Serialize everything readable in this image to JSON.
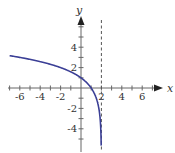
{
  "chart_data": {
    "type": "line",
    "title": "",
    "xlabel": "x",
    "ylabel": "y",
    "xlim": [
      -7,
      7.5
    ],
    "ylim": [
      -6,
      7
    ],
    "x_ticks": [
      -6,
      -4,
      -2,
      2,
      4,
      6
    ],
    "x_minor_ticks": [
      -7,
      -6,
      -5,
      -4,
      -3,
      -2,
      -1,
      1,
      2,
      3,
      4,
      5,
      6,
      7
    ],
    "y_ticks": [
      4,
      2,
      -2,
      -4
    ],
    "y_minor_ticks": [
      -5,
      -4,
      -3,
      -2,
      -1,
      1,
      2,
      3,
      4,
      5,
      6
    ],
    "x_tick_labels": [
      "-6",
      "-4",
      "-2",
      "2",
      "4",
      "6"
    ],
    "y_tick_labels": [
      "4",
      "2",
      "-2",
      "-4"
    ],
    "grid": false,
    "series": [
      {
        "name": "y = log2(2 - x)",
        "function": "log2(2 - x)",
        "domain": [
          -7,
          1.98
        ],
        "points": [
          [
            -7,
            3.17
          ],
          [
            -6,
            3
          ],
          [
            -4,
            2.58
          ],
          [
            -2,
            2
          ],
          [
            0,
            1
          ],
          [
            1,
            0
          ],
          [
            1.5,
            -1
          ],
          [
            1.75,
            -2
          ],
          [
            1.875,
            -3
          ],
          [
            1.9375,
            -4
          ],
          [
            1.97,
            -5
          ],
          [
            1.98,
            -5.6
          ]
        ],
        "color": "#3b3f96"
      }
    ],
    "asymptotes": [
      {
        "type": "vertical",
        "x": 2,
        "style": "dashed",
        "color": "#555555"
      }
    ]
  }
}
